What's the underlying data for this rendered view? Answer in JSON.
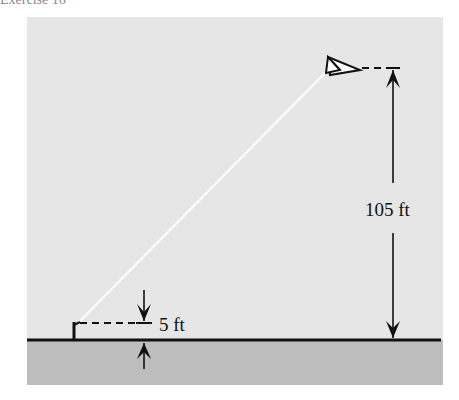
{
  "figure": {
    "header_fragment": "Exercise 16",
    "labels": {
      "kite_height": "105 ft",
      "hand_height": "5 ft"
    },
    "colors": {
      "sky": "#e6e6e6",
      "ground": "#bdbdbd",
      "line": "#111111",
      "string": "#ffffff"
    }
  }
}
